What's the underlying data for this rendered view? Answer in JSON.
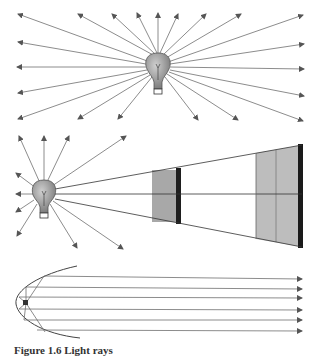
{
  "figure": {
    "panels": [
      {
        "id": "a",
        "description": "Light bulb radiating rays in all directions",
        "ray_count": 20
      },
      {
        "id": "b",
        "description": "Light bulb with rays spreading; cone of light illuminating two screens at increasing distance (inverse-square law)",
        "screens": 2
      },
      {
        "id": "c",
        "description": "Parabolic reflector with point source at focus producing parallel rays",
        "parallel_rays": 6
      }
    ],
    "caption": "Figure 1.6  Light rays",
    "colors": {
      "ray": "#707070",
      "bulb": "#9a9a9a",
      "screen_fill": "#b5b5b5",
      "screen_edge": "#1a1a1a"
    }
  }
}
